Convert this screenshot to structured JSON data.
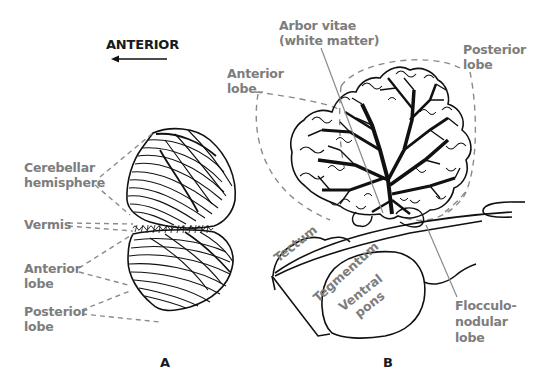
{
  "orientation": {
    "label": "ANTERIOR",
    "arrow_direction": "left"
  },
  "panel_a": {
    "letter": "A",
    "labels": {
      "cerebellar_hemisphere": "Cerebellar\nhemisphere",
      "vermis": "Vermis",
      "anterior_lobe": "Anterior\nlobe",
      "posterior_lobe": "Posterior\nlobe"
    }
  },
  "panel_b": {
    "letter": "B",
    "labels": {
      "arbor_vitae": "Arbor vitae\n(white matter)",
      "anterior_lobe": "Anterior\nlobe",
      "posterior_lobe": "Posterior\nlobe",
      "tectum": "Tectum",
      "tegmentum": "Tegmentum",
      "ventral_pons": "Ventral\npons",
      "flocculonodular_lobe": "Flocculo-\nnodular\nlobe"
    }
  },
  "colors": {
    "label_gray": "#7d7d7d",
    "line_dark": "#111111",
    "dash_gray": "#8a8a8a",
    "background": "#ffffff"
  }
}
